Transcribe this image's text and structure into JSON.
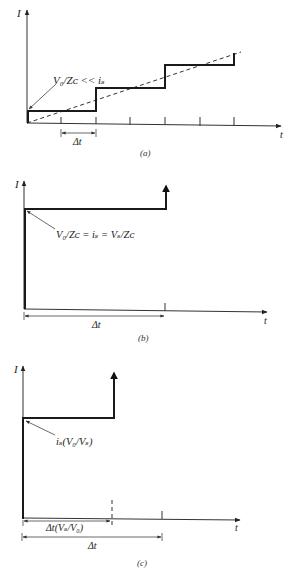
{
  "figure": {
    "panels": [
      {
        "id": "a",
        "caption": "(a)",
        "y_axis_label": "I",
        "x_axis_label": "t",
        "annotation": "V₀/Zᴄ << iₛ",
        "interval_label": "Δt",
        "description": "Staircase current rising in steps every 2Δt, approximating a dashed linear ramp"
      },
      {
        "id": "b",
        "caption": "(b)",
        "y_axis_label": "I",
        "x_axis_label": "t",
        "annotation": "V₀/Zᴄ = iₛ = Vₛ/Zᴄ",
        "interval_label": "Δt",
        "description": "Current jumps immediately to i_s, stays constant for Δt, then spikes up"
      },
      {
        "id": "c",
        "caption": "(c)",
        "y_axis_label": "I",
        "x_axis_label": "t",
        "annotation": "iₛ(V₀/Vₛ)",
        "interval_label_short": "Δt(Vₛ/V₀)",
        "interval_label": "Δt",
        "description": "Current jumps to i_s(V0/Vs), holds for Δt(Vs/V0) which is shorter than Δt, then spikes up"
      }
    ]
  },
  "colors": {
    "background": "#ffffff",
    "ink": "#1a1a1a"
  }
}
